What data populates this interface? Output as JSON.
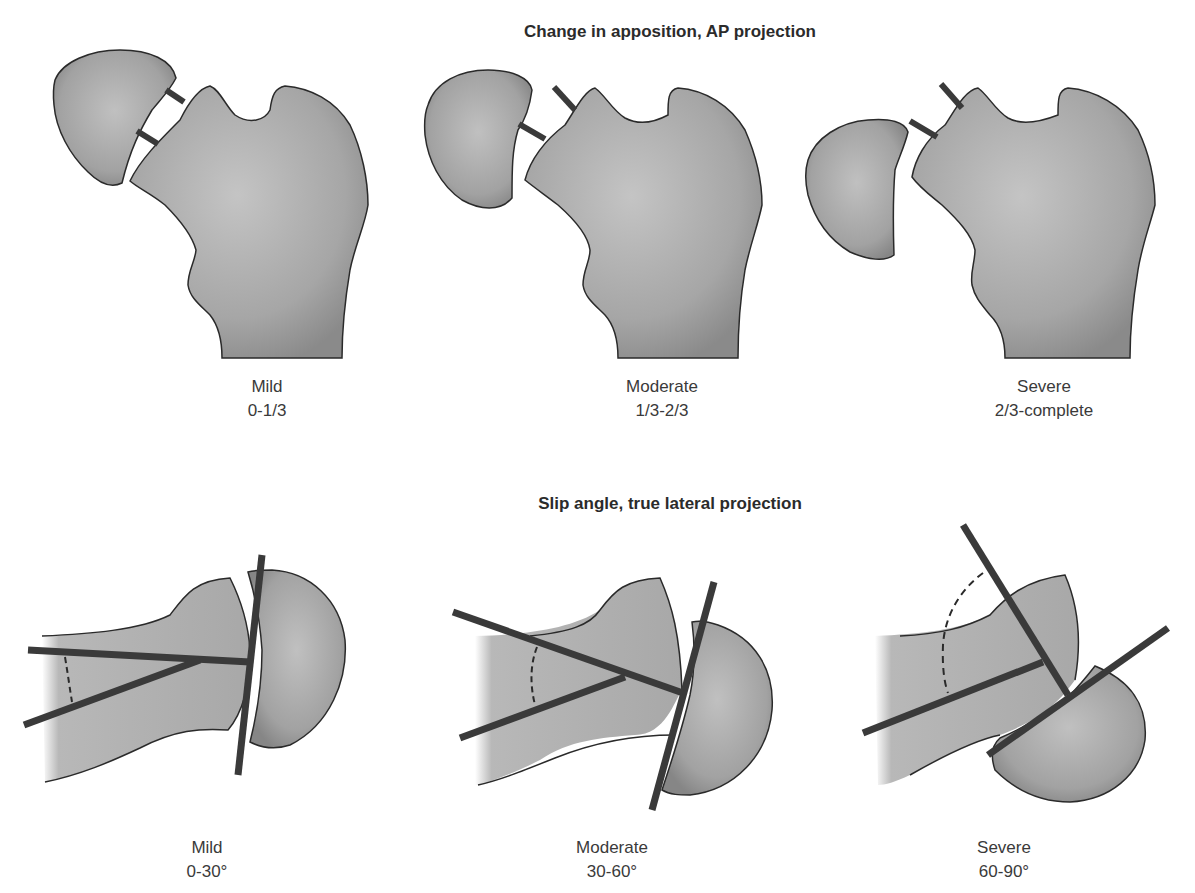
{
  "top_section": {
    "title": "Change in apposition, AP projection",
    "panels": [
      {
        "grade": "Mild",
        "range": "0-1/3"
      },
      {
        "grade": "Moderate",
        "range": "1/3-2/3"
      },
      {
        "grade": "Severe",
        "range": "2/3-complete"
      }
    ]
  },
  "bottom_section": {
    "title": "Slip angle, true lateral projection",
    "panels": [
      {
        "grade": "Mild",
        "range": "0-30°"
      },
      {
        "grade": "Moderate",
        "range": "30-60°"
      },
      {
        "grade": "Severe",
        "range": "60-90°"
      }
    ]
  },
  "colors": {
    "bone_fill": "#a9a9a9",
    "bone_outline": "#2a2a2a",
    "marker_bar": "#3a3a3a",
    "background": "#ffffff"
  }
}
